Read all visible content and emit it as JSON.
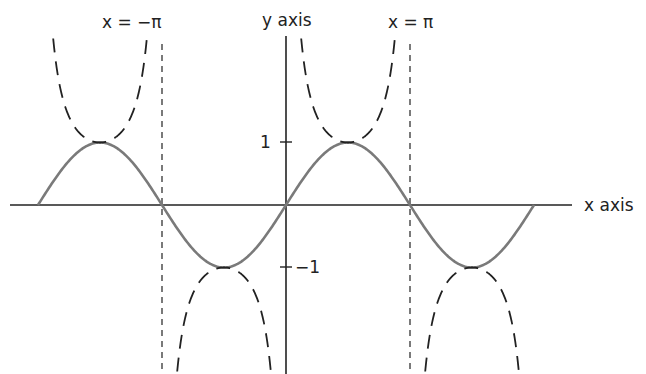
{
  "chart_data": {
    "type": "line",
    "title": "",
    "xlabel": "x axis",
    "ylabel": "y axis",
    "xlim": [
      -6.5,
      6.9
    ],
    "ylim": [
      -3.0,
      3.1
    ],
    "grid": false,
    "series": [
      {
        "name": "sin x",
        "style": "solid",
        "color": "#7a7a7a",
        "domain": [
          -6.2832,
          6.2832
        ]
      },
      {
        "name": "csc x",
        "style": "dashed",
        "color": "#222222",
        "domain": [
          -6.2832,
          6.2832
        ],
        "asymptotes": [
          -3.1416,
          0,
          3.1416
        ]
      }
    ],
    "annotations": [
      {
        "text": "x = −π",
        "x": -3.1416,
        "type": "vertical-dashed-line"
      },
      {
        "text": "x = π",
        "x": 3.1416,
        "type": "vertical-dashed-line"
      }
    ],
    "yticks": [
      {
        "value": 1,
        "label": "1"
      },
      {
        "value": -1,
        "label": "−1"
      }
    ]
  },
  "labels": {
    "y_axis": "y axis",
    "x_axis": "x axis",
    "x_neg_pi": "x = −π",
    "x_pi": "x = π",
    "tick_pos1": "1",
    "tick_neg1": "−1"
  }
}
